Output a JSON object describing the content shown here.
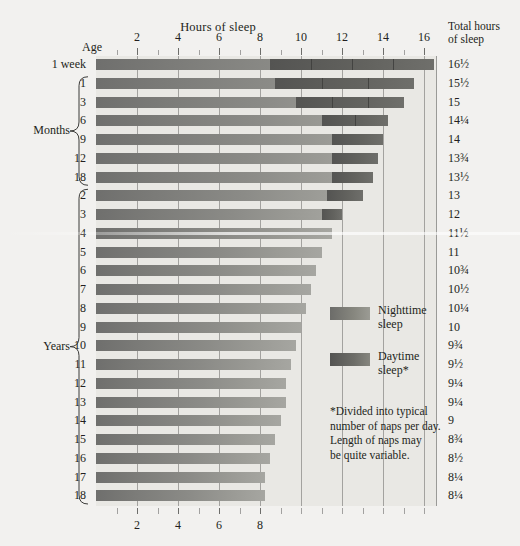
{
  "header": {
    "hours_title": "Hours of sleep",
    "total_title_line1": "Total hours",
    "total_title_line2": "of sleep",
    "age_title": "Age"
  },
  "groups": {
    "months_label": "Months",
    "years_label": "Years"
  },
  "legend": {
    "nighttime_label_line1": "Nighttime",
    "nighttime_label_line2": "sleep",
    "daytime_label_line1": "Daytime",
    "daytime_label_line2": "sleep*"
  },
  "footnote": {
    "line1": "*Divided into typical",
    "line2": "number of naps per day.",
    "line3": "Length of naps may",
    "line4": "be quite variable."
  },
  "chart_data": {
    "type": "bar",
    "title": "Hours of sleep",
    "xlabel": "Hours of sleep",
    "ylabel": "Age",
    "xlim": [
      0,
      16.6
    ],
    "grid": true,
    "legend_position": "right-middle",
    "axis_top_ticks": [
      2,
      4,
      6,
      8,
      10,
      12,
      14,
      16
    ],
    "axis_bottom_ticks": [
      2,
      4,
      6,
      8
    ],
    "gridlines_at": [
      2,
      4,
      6,
      8,
      10,
      12,
      14,
      16
    ],
    "categories": [
      "1 week",
      "1",
      "3",
      "6",
      "9",
      "12",
      "18",
      "2",
      "3",
      "4",
      "5",
      "6",
      "7",
      "8",
      "9",
      "10",
      "11",
      "12",
      "13",
      "14",
      "15",
      "16",
      "17",
      "18"
    ],
    "series": [
      {
        "name": "Nighttime sleep",
        "color": "#8b8b87",
        "values": [
          8.5,
          8.75,
          9.75,
          11.0,
          11.5,
          11.5,
          11.5,
          11.25,
          11.0,
          11.5,
          11.0,
          10.75,
          10.5,
          10.25,
          10.0,
          9.75,
          9.5,
          9.25,
          9.25,
          9.0,
          8.75,
          8.5,
          8.25,
          8.25
        ]
      },
      {
        "name": "Daytime sleep",
        "color": "#5b5b58",
        "values": [
          8.0,
          6.75,
          5.25,
          3.25,
          2.5,
          2.25,
          2.0,
          1.75,
          1.0,
          0,
          0,
          0,
          0,
          0,
          0,
          0,
          0,
          0,
          0,
          0,
          0,
          0,
          0,
          0
        ]
      }
    ],
    "naps_per_day": [
      4,
      3,
      3,
      2,
      1,
      1,
      1,
      1,
      1,
      0,
      0,
      0,
      0,
      0,
      0,
      0,
      0,
      0,
      0,
      0,
      0,
      0,
      0,
      0
    ],
    "totals": [
      16.5,
      15.5,
      15,
      14.25,
      14,
      13.75,
      13.5,
      13,
      12,
      11.5,
      11,
      10.75,
      10.5,
      10.25,
      10,
      9.75,
      9.5,
      9.25,
      9.25,
      9,
      8.75,
      8.5,
      8.25,
      8.25
    ],
    "total_labels": [
      "16½",
      "15½",
      "15",
      "14¼",
      "14",
      "13¾",
      "13½",
      "13",
      "12",
      "11½",
      "11",
      "10¾",
      "10½",
      "10¼",
      "10",
      "9¾",
      "9½",
      "9¼",
      "9¼",
      "9",
      "8¾",
      "8½",
      "8¼",
      "8¼"
    ],
    "group_months_rows": [
      1,
      6
    ],
    "group_years_rows": [
      7,
      23
    ]
  }
}
